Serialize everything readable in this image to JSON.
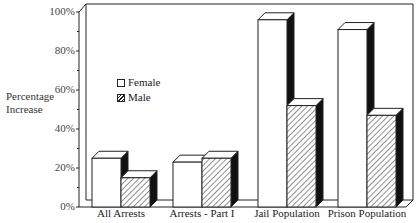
{
  "chart_data": {
    "type": "bar",
    "style": "3d-grouped",
    "title": "",
    "xlabel": "",
    "ylabel": "Percentage Increase",
    "ylim": [
      0,
      100
    ],
    "yticks": [
      "0%",
      "20%",
      "40%",
      "60%",
      "80%",
      "100%"
    ],
    "grid": false,
    "legend_position": "upper-left inside plot",
    "categories": [
      "All Arrests",
      "Arrests - Part I",
      "Jail Population",
      "Prison Population"
    ],
    "series": [
      {
        "name": "Female",
        "fill": "white",
        "values": [
          25,
          23,
          96,
          91
        ]
      },
      {
        "name": "Male",
        "fill": "hatched",
        "values": [
          15,
          25,
          52,
          47
        ]
      }
    ]
  },
  "labels": {
    "ylabel_line1": "Percentage",
    "ylabel_line2": "Increase",
    "legend_female": "Female",
    "legend_male": "Male"
  },
  "colors": {
    "line": "#222222",
    "bar_face": "#ffffff",
    "bar_side": "#111111"
  }
}
